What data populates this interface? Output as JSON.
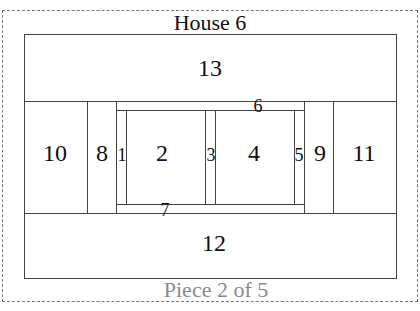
{
  "diagram": {
    "title": "House 6",
    "footer": "Piece 2 of 5",
    "colors": {
      "line": "#444444",
      "text": "#111111",
      "footer_text": "#8a8a8a",
      "frame_dash": "#777777"
    },
    "pieces": {
      "p1": "1",
      "p2": "2",
      "p3": "3",
      "p4": "4",
      "p5": "5",
      "p6": "6",
      "p7": "7",
      "p8": "8",
      "p9": "9",
      "p10": "10",
      "p11": "11",
      "p12": "12",
      "p13": "13"
    }
  }
}
